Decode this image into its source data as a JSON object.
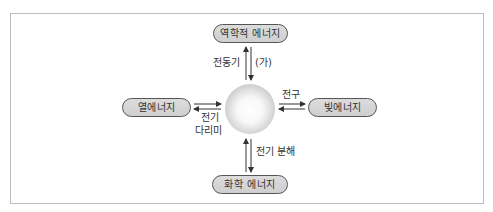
{
  "diagram": {
    "center": {
      "shape": "sphere"
    },
    "nodes": {
      "top": "역학적 에너지",
      "left": "열에너지",
      "right": "빛에너지",
      "bottom": "화학 에너지"
    },
    "edge_labels": {
      "top_left": "전동기",
      "top_right": "(가)",
      "right_top": "전구",
      "left_bottom_line1": "전기",
      "left_bottom_line2": "다리미",
      "bottom_right": "전기 분해"
    },
    "colors": {
      "box_fill": "#d5d5d5",
      "box_border": "#555555",
      "frame_border": "#bdbdbd",
      "arrow": "#333333"
    }
  }
}
